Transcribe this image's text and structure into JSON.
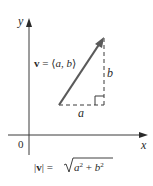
{
  "diagram": {
    "axes": {
      "x_label": "x",
      "y_label": "y",
      "origin_label": "0"
    },
    "vector": {
      "label_bold": "v",
      "label_eq": " = ⟨",
      "label_a": "a",
      "label_comma": ", ",
      "label_b": "b",
      "label_close": "⟩",
      "tail": [
        59,
        105
      ],
      "head": [
        104,
        37
      ]
    },
    "components": {
      "horizontal_label": "a",
      "vertical_label": "b",
      "right_angle_marker": true
    },
    "formula": {
      "bar_open": "|",
      "v": "v",
      "bar_close": "|",
      "eq": " = ",
      "a": "a",
      "exp2a": "2",
      "plus": " + ",
      "b": "b",
      "exp2b": "2"
    },
    "colors": {
      "axis": "#3a3a3a",
      "vector": "#5a5a5a",
      "dashed": "#3a3a3a",
      "text": "#2a2a2a"
    }
  }
}
